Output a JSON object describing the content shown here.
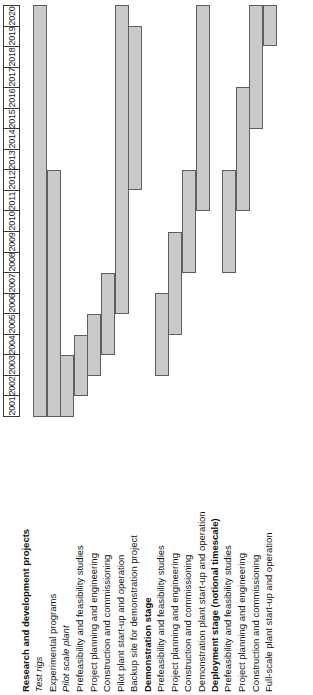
{
  "axis": {
    "name": "year-axis",
    "orientation": "vertical-descending",
    "years": [
      "2020",
      "2019",
      "2018",
      "2017",
      "2016",
      "2015",
      "2014",
      "2013",
      "2012",
      "2011",
      "2010",
      "2009",
      "2008",
      "2007",
      "2006",
      "2005",
      "2004",
      "2003",
      "2002",
      "2001"
    ]
  },
  "chart_data": {
    "type": "bar",
    "title": "",
    "xlabel": "",
    "ylabel": "",
    "orientation": "gantt-rotated",
    "axis_years": [
      2001,
      2020
    ],
    "grid": true,
    "legend": "none",
    "bar_fill": "#c9c9c9",
    "bar_border": "#5e5e5e",
    "groups": [
      {
        "name": "Research and development projects",
        "tasks": [
          {
            "label": "Test rigs",
            "italic": true,
            "start": 2001,
            "end": 2020
          },
          {
            "label": "Experimental programs",
            "italic": false,
            "start": 2001,
            "end": 2012
          },
          {
            "label": "Pilot scale plant",
            "italic": true,
            "start": 2001,
            "end": 2003
          },
          {
            "label": "Prefeasibility and feasibility studies",
            "italic": false,
            "start": 2002,
            "end": 2004
          },
          {
            "label": "Project planning and engineering",
            "italic": false,
            "start": 2003,
            "end": 2005
          },
          {
            "label": "Construction and commissioning",
            "italic": false,
            "start": 2004,
            "end": 2007
          },
          {
            "label": "Pilot plant start-up and operation",
            "italic": false,
            "start": 2006,
            "end": 2020
          },
          {
            "label": "Backup site for demonstration project",
            "italic": false,
            "start": 2012,
            "end": 2019
          }
        ]
      },
      {
        "name": "Demonstration stage",
        "tasks": [
          {
            "label": "Prefeasibility and feasibility studies",
            "italic": false,
            "start": 2003,
            "end": 2006
          },
          {
            "label": "Project planning and engineering",
            "italic": false,
            "start": 2005,
            "end": 2009
          },
          {
            "label": "Construction and commissioning",
            "italic": false,
            "start": 2008,
            "end": 2012
          },
          {
            "label": "Demonstration plant start-up and operation",
            "italic": false,
            "start": 2011,
            "end": 2020
          }
        ]
      },
      {
        "name": "Deployment stage (notional timescale)",
        "tasks": [
          {
            "label": "Prefeasibility and feasibility studies",
            "italic": false,
            "start": 2008,
            "end": 2012
          },
          {
            "label": "Project planning and engineering",
            "italic": false,
            "start": 2011,
            "end": 2016
          },
          {
            "label": "Construction and commissioning",
            "italic": false,
            "start": 2015,
            "end": 2020
          },
          {
            "label": "Full-scale plant start-up and operation",
            "italic": false,
            "start": 2019,
            "end": 2020
          }
        ]
      }
    ]
  }
}
